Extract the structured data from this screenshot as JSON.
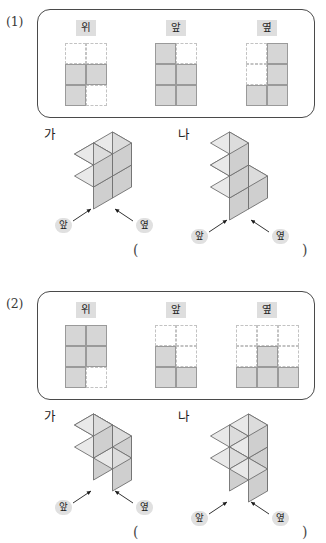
{
  "page": {
    "colors": {
      "cell_fill": "#d6d6d6",
      "cell_stroke": "#9a9a9a",
      "grid_dash": "#c3c3c3",
      "label_bg": "#dedede",
      "box_border": "#4a4a4a",
      "cube_top": "#e9e9e9",
      "cube_left": "#dcdcdc",
      "cube_right": "#cfcfcf",
      "cube_stroke": "#6f6f6f"
    }
  },
  "problems": [
    {
      "number": "(1)",
      "views": [
        {
          "label": "위",
          "cols": 2,
          "rows": 3,
          "cells": [
            [
              0,
              0
            ],
            [
              1,
              1
            ],
            [
              1,
              0
            ]
          ]
        },
        {
          "label": "앞",
          "cols": 2,
          "rows": 3,
          "cells": [
            [
              1,
              0
            ],
            [
              1,
              1
            ],
            [
              1,
              1
            ]
          ]
        },
        {
          "label": "옆",
          "cols": 2,
          "rows": 3,
          "cells": [
            [
              0,
              1
            ],
            [
              0,
              1
            ],
            [
              1,
              1
            ]
          ]
        }
      ],
      "figures": [
        {
          "name": "가",
          "front_label": "앞",
          "side_label": "옆",
          "cubes": [
            {
              "x": 0,
              "y": 0,
              "z": 0
            },
            {
              "x": 1,
              "y": 0,
              "z": 0
            },
            {
              "x": 1,
              "y": 1,
              "z": 0
            },
            {
              "x": 1,
              "y": 1,
              "z": 1
            },
            {
              "x": 1,
              "y": 0,
              "z": 1
            }
          ]
        },
        {
          "name": "나",
          "front_label": "앞",
          "side_label": "옆",
          "cubes": [
            {
              "x": 0,
              "y": 0,
              "z": 0
            },
            {
              "x": 1,
              "y": 0,
              "z": 0
            },
            {
              "x": 1,
              "y": 1,
              "z": 0
            },
            {
              "x": 1,
              "y": 1,
              "z": 1
            },
            {
              "x": 1,
              "y": 1,
              "z": 2
            }
          ]
        }
      ],
      "answer": {
        "open": "(",
        "close": ")",
        "value": ""
      }
    },
    {
      "number": "(2)",
      "views": [
        {
          "label": "위",
          "cols": 2,
          "rows": 3,
          "cells": [
            [
              1,
              1
            ],
            [
              1,
              1
            ],
            [
              1,
              0
            ]
          ]
        },
        {
          "label": "앞",
          "cols": 2,
          "rows": 3,
          "cells": [
            [
              0,
              0
            ],
            [
              1,
              0
            ],
            [
              1,
              1
            ]
          ]
        },
        {
          "label": "옆",
          "cols": 3,
          "rows": 3,
          "cells": [
            [
              0,
              0,
              0
            ],
            [
              0,
              1,
              0
            ],
            [
              1,
              1,
              1
            ]
          ]
        }
      ],
      "figures": [
        {
          "name": "가",
          "front_label": "앞",
          "side_label": "옆",
          "cubes": [
            {
              "x": 0,
              "y": 0,
              "z": 0
            },
            {
              "x": 1,
              "y": 0,
              "z": 0
            },
            {
              "x": 1,
              "y": 1,
              "z": 0
            },
            {
              "x": 2,
              "y": 1,
              "z": 0
            },
            {
              "x": 1,
              "y": 1,
              "z": 1
            }
          ]
        },
        {
          "name": "나",
          "front_label": "앞",
          "side_label": "옆",
          "cubes": [
            {
              "x": 0,
              "y": 0,
              "z": 0
            },
            {
              "x": 1,
              "y": 0,
              "z": 0
            },
            {
              "x": 1,
              "y": 1,
              "z": 0
            },
            {
              "x": 2,
              "y": 1,
              "z": 0
            },
            {
              "x": 1,
              "y": 0,
              "z": 1
            }
          ]
        }
      ],
      "answer": {
        "open": "(",
        "close": ")",
        "value": ""
      }
    }
  ]
}
